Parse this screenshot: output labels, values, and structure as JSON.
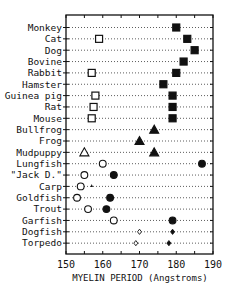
{
  "chart_data": {
    "type": "scatter",
    "title": "",
    "xlabel": "MYELIN PERIOD (Angstroms)",
    "ylabel": "",
    "xlim": [
      150,
      190
    ],
    "xticks": [
      150,
      160,
      170,
      180,
      190
    ],
    "grid": "dotted horizontal guide per row",
    "legend": "none",
    "categories": [
      "Monkey",
      "Cat",
      "Dog",
      "Bovine",
      "Rabbit",
      "Hamster",
      "Guinea pig",
      "Rat",
      "Mouse",
      "Bullfrog",
      "Frog",
      "Mudpuppy",
      "Lungfish",
      "\"Jack D.\"",
      "Carp",
      "Goldfish",
      "Trout",
      "Garfish",
      "Dogfish",
      "Torpedo"
    ],
    "series": [
      {
        "name": "PNS (filled)",
        "values": [
          180,
          183,
          185,
          182,
          180,
          176.5,
          179,
          179,
          179,
          174,
          170,
          174,
          187,
          163,
          null,
          162,
          161,
          179,
          179,
          178
        ]
      },
      {
        "name": "CNS (open)",
        "values": [
          null,
          159,
          null,
          null,
          157,
          null,
          158,
          157.5,
          157,
          null,
          null,
          155,
          160,
          155,
          154,
          153,
          156,
          163,
          170,
          169
        ]
      },
      {
        "name": "Carp extra mark",
        "values": [
          null,
          null,
          null,
          null,
          null,
          null,
          null,
          null,
          null,
          null,
          null,
          null,
          null,
          null,
          157,
          null,
          null,
          null,
          null,
          null
        ]
      }
    ],
    "markers": {
      "mammals": "square",
      "amphibians": "triangle",
      "fish": "circle",
      "elasmobranchs": "small diamond"
    }
  },
  "axis": {
    "xlabel": "MYELIN PERIOD  (Angstroms)",
    "ticks": [
      "150",
      "160",
      "170",
      "180",
      "190"
    ]
  },
  "rows": [
    {
      "label": "Monkey",
      "shape": "square",
      "filled": 180,
      "open": null
    },
    {
      "label": "Cat",
      "shape": "square",
      "filled": 183,
      "open": 159
    },
    {
      "label": "Dog",
      "shape": "square",
      "filled": 185,
      "open": null
    },
    {
      "label": "Bovine",
      "shape": "square",
      "filled": 182,
      "open": null
    },
    {
      "label": "Rabbit",
      "shape": "square",
      "filled": 180,
      "open": 157
    },
    {
      "label": "Hamster",
      "shape": "square",
      "filled": 176.5,
      "open": null
    },
    {
      "label": "Guinea pig",
      "shape": "square",
      "filled": 179,
      "open": 158
    },
    {
      "label": "Rat",
      "shape": "square",
      "filled": 179,
      "open": 157.5
    },
    {
      "label": "Mouse",
      "shape": "square",
      "filled": 179,
      "open": 157
    },
    {
      "label": "Bullfrog",
      "shape": "triangle",
      "filled": 174,
      "open": null
    },
    {
      "label": "Frog",
      "shape": "triangle",
      "filled": 170,
      "open": null
    },
    {
      "label": "Mudpuppy",
      "shape": "triangle",
      "filled": 174,
      "open": 155
    },
    {
      "label": "Lungfish",
      "shape": "circle",
      "filled": 187,
      "open": 160
    },
    {
      "label": "\"Jack D.\"",
      "shape": "circle",
      "filled": 163,
      "open": 155
    },
    {
      "label": "Carp",
      "shape": "circle",
      "filled": null,
      "open": 154,
      "extra": 157
    },
    {
      "label": "Goldfish",
      "shape": "circle",
      "filled": 162,
      "open": 153
    },
    {
      "label": "Trout",
      "shape": "circle",
      "filled": 161,
      "open": 156
    },
    {
      "label": "Garfish",
      "shape": "circle",
      "filled": 179,
      "open": 163
    },
    {
      "label": "Dogfish",
      "shape": "diamond",
      "filled": 179,
      "open": 170
    },
    {
      "label": "Torpedo",
      "shape": "diamond",
      "filled": 178,
      "open": 169
    }
  ]
}
